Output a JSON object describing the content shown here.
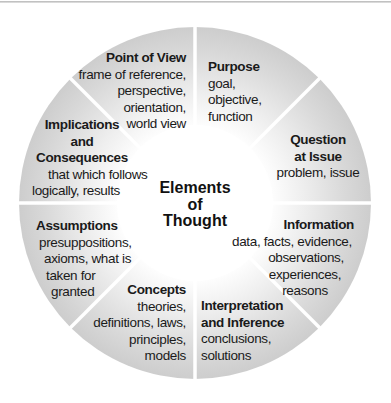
{
  "diagram": {
    "title_lines": [
      "Elements",
      "of",
      "Thought"
    ],
    "colors": {
      "sector_outer": "#cfcfcf",
      "sector_inner": "#ffffff",
      "divider": "#ffffff",
      "text": "#1a1a1a"
    },
    "elements": [
      {
        "id": "point-of-view",
        "title_lines": [
          "Point of View"
        ],
        "description_lines": [
          "frame of reference,",
          "perspective,",
          "orientation,",
          "world view"
        ]
      },
      {
        "id": "purpose",
        "title_lines": [
          "Purpose"
        ],
        "description_lines": [
          "goal,",
          "objective,",
          "function"
        ]
      },
      {
        "id": "question-at-issue",
        "title_lines": [
          "Question",
          "at Issue"
        ],
        "description_lines": [
          "problem, issue"
        ]
      },
      {
        "id": "information",
        "title_lines": [
          "Information"
        ],
        "description_lines": [
          "data, facts, evidence,",
          "observations,",
          "experiences,",
          "reasons"
        ]
      },
      {
        "id": "interpretation-and-inference",
        "title_lines": [
          "Interpretation",
          "and Inference"
        ],
        "description_lines": [
          "conclusions,",
          "solutions"
        ]
      },
      {
        "id": "concepts",
        "title_lines": [
          "Concepts"
        ],
        "description_lines": [
          "theories,",
          "definitions, laws,",
          "principles,",
          "models"
        ]
      },
      {
        "id": "assumptions",
        "title_lines": [
          "Assumptions"
        ],
        "description_lines": [
          "presuppositions,",
          "axioms, what is",
          "taken for",
          "granted"
        ]
      },
      {
        "id": "implications-and-consequences",
        "title_lines": [
          "Implications",
          "and",
          "Consequences"
        ],
        "description_lines": [
          "that which follows",
          "logically, results"
        ]
      }
    ]
  }
}
